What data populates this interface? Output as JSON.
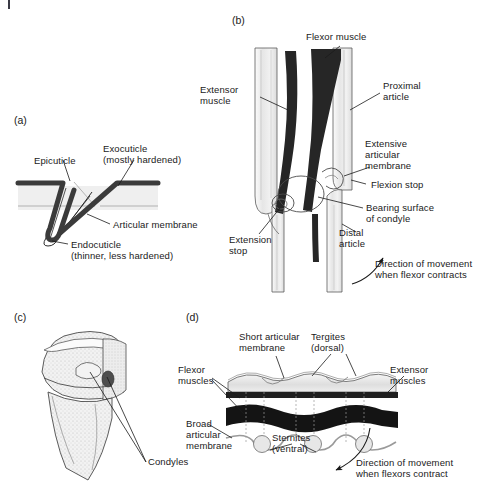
{
  "figure": {
    "background_color": "#ffffff",
    "ink_color": "#1a1a1a",
    "panels": [
      {
        "id": "a",
        "id_label": "(a)",
        "subject": "Cutaneous joint fold cross-section",
        "labels": [
          {
            "name": "epicuticle",
            "text": "Epicuticle"
          },
          {
            "name": "exocuticle",
            "text": "Exocuticle\n(mostly hardened)"
          },
          {
            "name": "articular-membrane",
            "text": "Articular membrane"
          },
          {
            "name": "endocuticle",
            "text": "Endocuticle\n(thinner, less hardened)"
          }
        ]
      },
      {
        "id": "b",
        "id_label": "(b)",
        "subject": "Leg joint with flexor and extensor muscles",
        "labels": [
          {
            "name": "flexor-muscle",
            "text": "Flexor muscle"
          },
          {
            "name": "extensor-muscle",
            "text": "Extensor\nmuscle"
          },
          {
            "name": "proximal-article",
            "text": "Proximal\narticle"
          },
          {
            "name": "extensive-articular-membrane",
            "text": "Extensive\narticular\nmembrane"
          },
          {
            "name": "flexion-stop",
            "text": "Flexion stop"
          },
          {
            "name": "bearing-surface-of-condyle",
            "text": "Bearing surface\nof condyle"
          },
          {
            "name": "extension-stop",
            "text": "Extension\nstop"
          },
          {
            "name": "distal-article",
            "text": "Distal\narticle"
          },
          {
            "name": "direction-of-movement",
            "text": "Direction of movement\nwhen flexor contracts"
          }
        ]
      },
      {
        "id": "c",
        "id_label": "(c)",
        "subject": "Three-dimensional view of articulating condyles",
        "labels": [
          {
            "name": "condyles",
            "text": "Condyles"
          }
        ]
      },
      {
        "id": "d",
        "id_label": "(d)",
        "subject": "Abdominal segments with tergites and sternites",
        "labels": [
          {
            "name": "short-articular-membrane",
            "text": "Short articular\nmembrane"
          },
          {
            "name": "tergites-dorsal",
            "text": "Tergites\n(dorsal)"
          },
          {
            "name": "flexor-muscles",
            "text": "Flexor\nmuscles"
          },
          {
            "name": "extensor-muscles",
            "text": "Extensor\nmuscles"
          },
          {
            "name": "broad-articular-membrane",
            "text": "Broad\narticular\nmembrane"
          },
          {
            "name": "sternites-ventral",
            "text": "Sternites\n(ventral)"
          },
          {
            "name": "direction-of-movement",
            "text": "Direction of movement\nwhen flexors contract"
          }
        ]
      }
    ],
    "colors": {
      "ink": "#1a1a1a",
      "cuticle_dark": "#3b3b3b",
      "muscle_dark": "#262626",
      "article_fill": "#ececec",
      "article_fill_light": "#f4f4f4",
      "tergite_fill": "#e3e3e3",
      "membrane_gray": "#b8b8b8",
      "stipple_gray": "#cfcfcf"
    }
  }
}
